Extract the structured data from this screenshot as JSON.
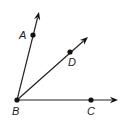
{
  "diagram": {
    "type": "geometry-rays",
    "vertex": {
      "label": "B",
      "x": 17,
      "y": 100,
      "label_x": 12,
      "label_y": 115
    },
    "rays": [
      {
        "name": "BA",
        "point": {
          "label": "A",
          "x": 33,
          "y": 35,
          "label_x": 19,
          "label_y": 39
        },
        "tip": {
          "x": 39,
          "y": 12
        }
      },
      {
        "name": "BD",
        "point": {
          "label": "D",
          "x": 70,
          "y": 52,
          "label_x": 68,
          "label_y": 66
        },
        "tip": {
          "x": 88,
          "y": 37
        }
      },
      {
        "name": "BC",
        "point": {
          "label": "C",
          "x": 91,
          "y": 100,
          "label_x": 87,
          "label_y": 115
        },
        "tip": {
          "x": 118,
          "y": 100
        }
      }
    ],
    "colors": {
      "line": "#222222",
      "point": "#111111",
      "background": "#ffffff"
    }
  }
}
